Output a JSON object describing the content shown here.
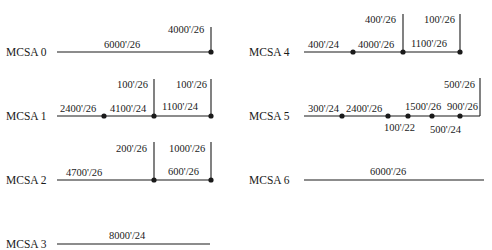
{
  "diagram": {
    "stations": [
      {
        "name": "MCSA 0",
        "segments": [
          "6000'/26"
        ],
        "branches": [
          "4000'/26"
        ]
      },
      {
        "name": "MCSA 1",
        "segments": [
          "2400'/26",
          "4100'/24",
          "1100'/24"
        ],
        "branches": [
          "100'/26",
          "100'/26"
        ]
      },
      {
        "name": "MCSA 2",
        "segments": [
          "4700'/26",
          "600'/26"
        ],
        "branches": [
          "200'/26",
          "1000'/26"
        ]
      },
      {
        "name": "MCSA 3",
        "segments": [
          "8000'/24"
        ],
        "branches": []
      },
      {
        "name": "MCSA 4",
        "segments": [
          "400'/24",
          "4000'/26",
          "1100'/26"
        ],
        "branches": [
          "400'/26",
          "100'/26"
        ]
      },
      {
        "name": "MCSA 5",
        "segments": [
          "300'/24",
          "2400'/26",
          "1500'/26",
          "900'/26"
        ],
        "branches": [
          "500'/26"
        ],
        "below_labels": [
          "100'/22",
          "500'/24"
        ]
      },
      {
        "name": "MCSA 6",
        "segments": [
          "6000'/26"
        ],
        "branches": []
      }
    ]
  }
}
